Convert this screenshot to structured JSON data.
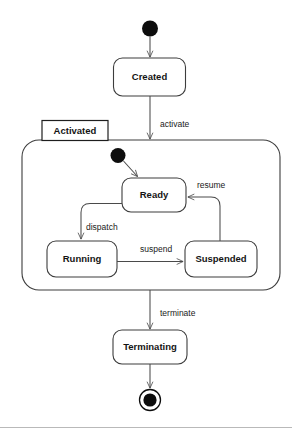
{
  "diagram": {
    "kind": "uml-state-machine",
    "background_color": "#ffffff",
    "line_color": "#4a4a4a",
    "node_fill": "#ffffff",
    "marker_color": "#0d0d0d"
  },
  "states": [
    {
      "id": "created",
      "label": "Created"
    },
    {
      "id": "ready",
      "label": "Ready"
    },
    {
      "id": "running",
      "label": "Running"
    },
    {
      "id": "suspended",
      "label": "Suspended"
    },
    {
      "id": "terminating",
      "label": "Terminating"
    }
  ],
  "regions": [
    {
      "id": "activated",
      "label": "Activated"
    }
  ],
  "pseudostates": [
    {
      "id": "initial-top",
      "kind": "initial"
    },
    {
      "id": "initial-activated",
      "kind": "initial"
    },
    {
      "id": "final-bottom",
      "kind": "final"
    }
  ],
  "transitions": [
    {
      "id": "t-start",
      "label": "",
      "from": "initial-top",
      "to": "created"
    },
    {
      "id": "t-activate",
      "label": "activate",
      "from": "created",
      "to": "activated"
    },
    {
      "id": "t-enter",
      "label": "",
      "from": "initial-activated",
      "to": "ready"
    },
    {
      "id": "t-dispatch",
      "label": "dispatch",
      "from": "ready",
      "to": "running"
    },
    {
      "id": "t-suspend",
      "label": "suspend",
      "from": "running",
      "to": "suspended"
    },
    {
      "id": "t-resume",
      "label": "resume",
      "from": "suspended",
      "to": "ready"
    },
    {
      "id": "t-terminate",
      "label": "terminate",
      "from": "activated",
      "to": "terminating"
    },
    {
      "id": "t-end",
      "label": "",
      "from": "terminating",
      "to": "final-bottom"
    }
  ]
}
